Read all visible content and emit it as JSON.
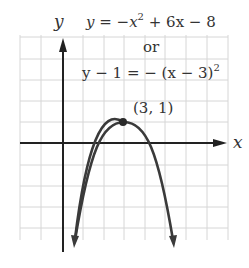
{
  "figure": {
    "type": "parabola-graph",
    "equation_standard": "y = −x² + 6x − 8",
    "equation_standard_parts": {
      "lhs": "y = −x",
      "sup": "2",
      "rhs": " + 6x − 8"
    },
    "connector": "or",
    "equation_vertex_parts": {
      "lhs": "y − 1 = − (x − 3)",
      "sup": "2"
    },
    "vertex_label": "(3, 1)",
    "x_axis_label": "x",
    "y_axis_label": "y",
    "vertex": [
      3,
      1
    ],
    "x_intercepts": [
      2,
      4
    ],
    "grid": {
      "x_min": -2,
      "x_max": 8,
      "y_min": -10,
      "y_max": 5,
      "step": 1
    },
    "colors": {
      "grid": "#d6d6d6",
      "axis": "#222222",
      "curve": "#3a3a3a",
      "text": "#333333"
    }
  }
}
